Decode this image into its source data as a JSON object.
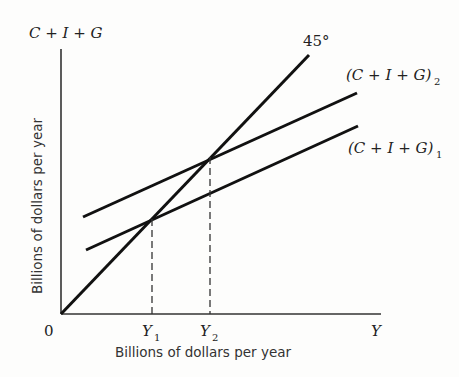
{
  "diagram": {
    "y_axis_title": "C + I + G",
    "y_axis_label": "Billions of dollars per year",
    "x_axis_label": "Billions of dollars per year",
    "x_axis_end": "Y",
    "origin": "0",
    "ticks": [
      {
        "main": "Y",
        "sub": "1"
      },
      {
        "main": "Y",
        "sub": "2"
      }
    ],
    "lines": [
      {
        "name": "45-degree line",
        "label": "45°"
      },
      {
        "name": "aggregate expenditure 2",
        "label_main": "(C + I + G)",
        "label_sub": "2"
      },
      {
        "name": "aggregate expenditure 1",
        "label_main": "(C + I + G)",
        "label_sub": "1"
      }
    ],
    "colors": {
      "line": "#111111",
      "background": "#fdfdfc"
    }
  }
}
